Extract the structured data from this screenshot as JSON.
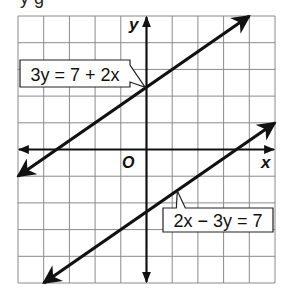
{
  "figure": {
    "top_cutoff_text": "y g",
    "axes": {
      "x_label": "x",
      "y_label": "y",
      "origin_label": "O",
      "x_range": [
        -5,
        5
      ],
      "y_range": [
        -5,
        5
      ],
      "grid": true,
      "grid_step": 1
    },
    "lines": [
      {
        "equation": "3y = 7 + 2x",
        "slope": 0.6667,
        "intercept": 2.3333,
        "from": [
          -5,
          -1
        ],
        "to": [
          4,
          5
        ],
        "label_box": {
          "x1": -4.9,
          "y1": 3.35,
          "x2": -0.65,
          "y2": 2.35
        },
        "pointer_to": [
          -0.05,
          2.33
        ]
      },
      {
        "equation": "2x − 3y = 7",
        "slope": 0.6667,
        "intercept": -2.3333,
        "from": [
          -4,
          -5
        ],
        "to": [
          5,
          1
        ],
        "label_box": {
          "x1": 0.6,
          "y1": -2.2,
          "x2": 4.9,
          "y2": -3.05
        },
        "pointer_to": [
          1.2,
          -1.55
        ]
      }
    ],
    "colors": {
      "line": "#111111",
      "grid": "#8a8a8a",
      "axis": "#111111",
      "background": "#ffffff"
    }
  }
}
